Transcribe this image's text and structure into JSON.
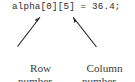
{
  "figure": {
    "background_color": "#ffffff",
    "text_color": "#2b2b2b",
    "arrow_color": "#1a1a1a",
    "code": {
      "full_text": "alpha[0][5] = 36.4;",
      "array_name": "alpha",
      "row_subscript": "0",
      "column_subscript": "5",
      "operator": "=",
      "value": "36.4",
      "terminator": ";"
    },
    "annotations": [
      {
        "id": "row-annotation",
        "label_line1": "Row",
        "label_line2": "number",
        "points_to": "row_subscript",
        "arrow_direction": "up-right"
      },
      {
        "id": "column-annotation",
        "label_line1": "Column",
        "label_line2": "number",
        "points_to": "column_subscript",
        "arrow_direction": "up-left"
      }
    ]
  }
}
